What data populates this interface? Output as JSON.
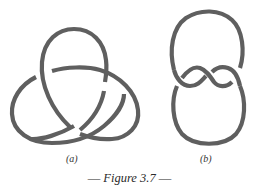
{
  "figure": {
    "caption": {
      "dash_left": "—",
      "title": "Figure 3.7",
      "dash_right": "—"
    },
    "panels": [
      {
        "label": "(a)",
        "knot": "trefoil-knot"
      },
      {
        "label": "(b)",
        "knot": "figure-eight-knot"
      }
    ],
    "stroke_color": "#5f5f5f",
    "background_color": "#ffffff"
  }
}
